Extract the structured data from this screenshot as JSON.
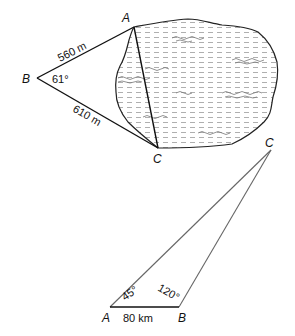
{
  "figure1": {
    "title": "Lake triangulation",
    "vertices": {
      "A": {
        "label": "A",
        "x": 134,
        "y": 27
      },
      "B": {
        "label": "B",
        "x": 37,
        "y": 78
      },
      "C": {
        "label": "C",
        "x": 158,
        "y": 148
      }
    },
    "side_BA": {
      "label": "560  m"
    },
    "side_BC": {
      "label": "610  m"
    },
    "angle_B": {
      "label": "61°"
    },
    "lake": {
      "fill_pattern": "horizontal-dashes",
      "color": "#555555"
    }
  },
  "figure2": {
    "title": "Triangle with base AB",
    "vertices": {
      "A": {
        "label": "A",
        "x": 110,
        "y": 307
      },
      "B": {
        "label": "B",
        "x": 179,
        "y": 307
      },
      "C": {
        "label": "C",
        "x": 271,
        "y": 150
      }
    },
    "side_AB": {
      "label": "80  km"
    },
    "angle_A": {
      "label": "45°"
    },
    "angle_B": {
      "label": "120°"
    },
    "side_color": "#666666",
    "base_color": "#111111"
  }
}
